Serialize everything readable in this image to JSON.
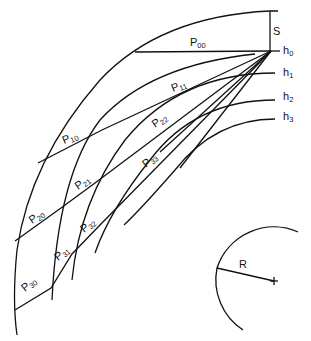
{
  "diagram": {
    "labels": {
      "s": "S",
      "h0": "h",
      "h0_sub": "0",
      "h1": "h",
      "h1_sub": "1",
      "h2": "h",
      "h2_sub": "2",
      "h3": "h",
      "h3_sub": "3",
      "r": "R"
    },
    "paths": [
      {
        "id": "P00",
        "main": "P",
        "sub": "00"
      },
      {
        "id": "P10",
        "main": "P",
        "sub": "10"
      },
      {
        "id": "P11",
        "main": "P",
        "sub": "11"
      },
      {
        "id": "P20",
        "main": "P",
        "sub": "20"
      },
      {
        "id": "P21",
        "main": "P",
        "sub": "21"
      },
      {
        "id": "P22",
        "main": "P",
        "sub": "22"
      },
      {
        "id": "P30",
        "main": "P",
        "sub": "30"
      },
      {
        "id": "P31",
        "main": "P",
        "sub": "31"
      },
      {
        "id": "P32",
        "main": "P",
        "sub": "32"
      },
      {
        "id": "P33",
        "main": "P",
        "sub": "33"
      }
    ],
    "colors": {
      "line": "#111111",
      "background": "#ffffff"
    }
  }
}
